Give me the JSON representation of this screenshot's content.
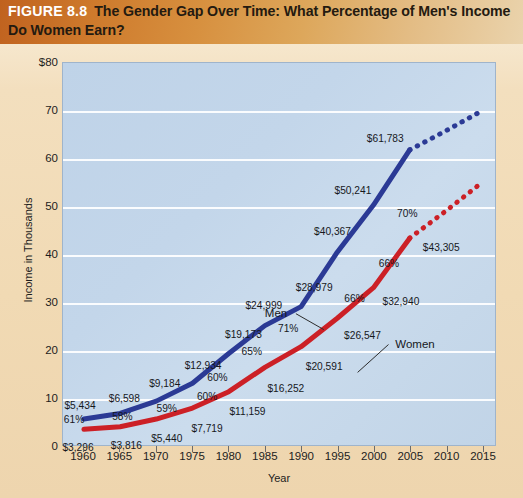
{
  "figure": {
    "number": "FIGURE 8.8",
    "title": "The Gender Gap Over Time: What Percentage of Men's Income Do Women Earn?"
  },
  "colors": {
    "men_line": "#2b3a95",
    "women_line": "#cc2026",
    "plot_background": "#c4d6e9",
    "gridline": "#ffffff",
    "banner_start": "#c0621f",
    "banner_end": "#ead3ac",
    "page_background": "#f1dab4"
  },
  "chart_data": {
    "type": "line",
    "title": "The Gender Gap Over Time: What Percentage of Men's Income Do Women Earn?",
    "xlabel": "Year",
    "ylabel": "Income in Thousands",
    "xlim": [
      1960,
      2015
    ],
    "ylim": [
      0,
      80
    ],
    "grid": true,
    "legend": "inline-annotation",
    "x": [
      1960,
      1965,
      1970,
      1975,
      1980,
      1985,
      1990,
      1995,
      2000,
      2005,
      2010,
      2015
    ],
    "yticks": [
      "0",
      "10",
      "20",
      "30",
      "40",
      "50",
      "60",
      "70",
      "$80"
    ],
    "ytick_values": [
      0,
      10,
      20,
      30,
      40,
      50,
      60,
      70,
      80
    ],
    "xticks": [
      "1960",
      "1965",
      "1970",
      "1975",
      "1980",
      "1985",
      "1990",
      "1995",
      "2000",
      "2005",
      "2010",
      "2015"
    ],
    "series": [
      {
        "name": "Men",
        "color": "#2b3a95",
        "values": [
          5434,
          6598,
          9184,
          12934,
          19173,
          24999,
          28979,
          40367,
          50241,
          61783,
          65800,
          70000
        ],
        "solid_through": 2005,
        "projected_from": 2005,
        "labels": [
          {
            "x": 1960,
            "text": "$5,434"
          },
          {
            "x": 1965,
            "text": "$6,598"
          },
          {
            "x": 1970,
            "text": "$9,184"
          },
          {
            "x": 1975,
            "text": "$12,934"
          },
          {
            "x": 1980,
            "text": "$19,173"
          },
          {
            "x": 1985,
            "text": "$24,999"
          },
          {
            "x": 1990,
            "text": "$28,979"
          },
          {
            "x": 1995,
            "text": "$40,367"
          },
          {
            "x": 2000,
            "text": "$50,241"
          },
          {
            "x": 2005,
            "text": "$61,783"
          }
        ]
      },
      {
        "name": "Women",
        "color": "#cc2026",
        "values": [
          3296,
          3816,
          5440,
          7719,
          11159,
          16252,
          20591,
          26547,
          32940,
          43305,
          49000,
          55000
        ],
        "solid_through": 2005,
        "projected_from": 2005,
        "labels": [
          {
            "x": 1960,
            "text": "$3,296"
          },
          {
            "x": 1965,
            "text": "$3,816"
          },
          {
            "x": 1970,
            "text": "$5,440"
          },
          {
            "x": 1975,
            "text": "$7,719"
          },
          {
            "x": 1980,
            "text": "$11,159"
          },
          {
            "x": 1985,
            "text": "$16,252"
          },
          {
            "x": 1990,
            "text": "$20,591"
          },
          {
            "x": 1995,
            "text": "$26,547"
          },
          {
            "x": 2000,
            "text": "$32,940"
          },
          {
            "x": 2005,
            "text": "$43,305"
          }
        ]
      }
    ],
    "ratio_labels": [
      {
        "x": 1960,
        "text": "61%"
      },
      {
        "x": 1965,
        "text": "58%"
      },
      {
        "x": 1970,
        "text": "59%"
      },
      {
        "x": 1975,
        "text": "60%"
      },
      {
        "x": 1980,
        "text": "60%"
      },
      {
        "x": 1985,
        "text": "65%"
      },
      {
        "x": 1990,
        "text": "71%"
      },
      {
        "x": 1995,
        "text": "66%"
      },
      {
        "x": 2000,
        "text": "66%"
      },
      {
        "x": 2005,
        "text": "70%"
      }
    ],
    "annotations": [
      {
        "label": "Men",
        "series": "Men"
      },
      {
        "label": "Women",
        "series": "Women"
      }
    ]
  },
  "labels": {
    "men_annotation": "Men",
    "women_annotation": "Women",
    "y_axis_title": "Income in Thousands",
    "x_axis_title": "Year"
  }
}
